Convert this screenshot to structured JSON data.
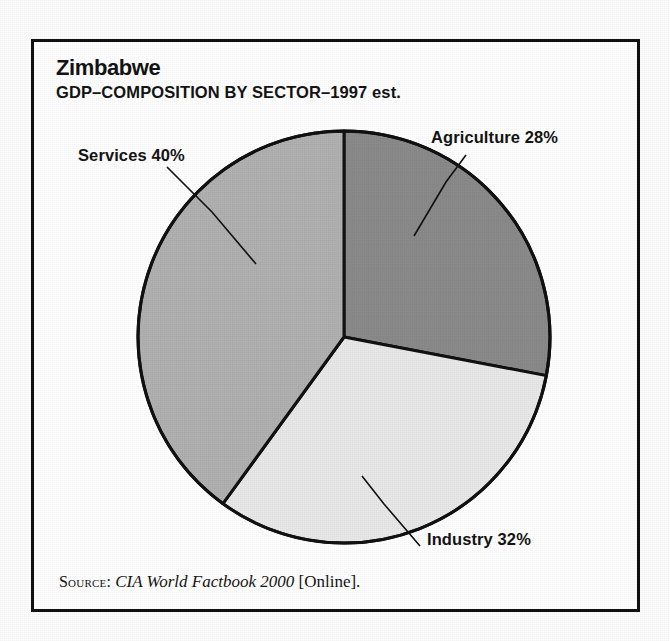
{
  "figure": {
    "title": "Zimbabwe",
    "subtitle": "GDP–COMPOSITION BY SECTOR–1997 est."
  },
  "source": {
    "label": "Source:",
    "title": "CIA World Factbook 2000",
    "suffix": "[Online]."
  },
  "labels": {
    "services": "Services 40%",
    "agriculture": "Agriculture 28%",
    "industry": "Industry 32%"
  },
  "colors": {
    "agriculture": "#8b8b8b",
    "industry": "#e9e9e9",
    "services": "#b2b2b2",
    "outline": "#111111",
    "background": "#ffffff",
    "text": "#141414"
  },
  "chart_data": {
    "type": "pie",
    "title": "Zimbabwe",
    "subtitle": "GDP–COMPOSITION BY SECTOR–1997 est.",
    "xlabel": "",
    "ylabel": "",
    "units": "percent",
    "total": 100,
    "start_angle_deg": 0,
    "direction": "clockwise",
    "legend": "none (direct labels with leader lines)",
    "categories": [
      "Agriculture",
      "Industry",
      "Services"
    ],
    "values": [
      28,
      32,
      40
    ],
    "slices": [
      {
        "name": "Agriculture",
        "value": 28,
        "label": "Agriculture 28%",
        "color": "#8b8b8b",
        "start_deg": 0,
        "end_deg": 100.8,
        "label_position": "upper-right"
      },
      {
        "name": "Industry",
        "value": 32,
        "label": "Industry 32%",
        "color": "#e9e9e9",
        "start_deg": 100.8,
        "end_deg": 216.0,
        "label_position": "lower-right"
      },
      {
        "name": "Services",
        "value": 40,
        "label": "Services 40%",
        "color": "#b2b2b2",
        "start_deg": 216.0,
        "end_deg": 360.0,
        "label_position": "upper-left"
      }
    ]
  }
}
